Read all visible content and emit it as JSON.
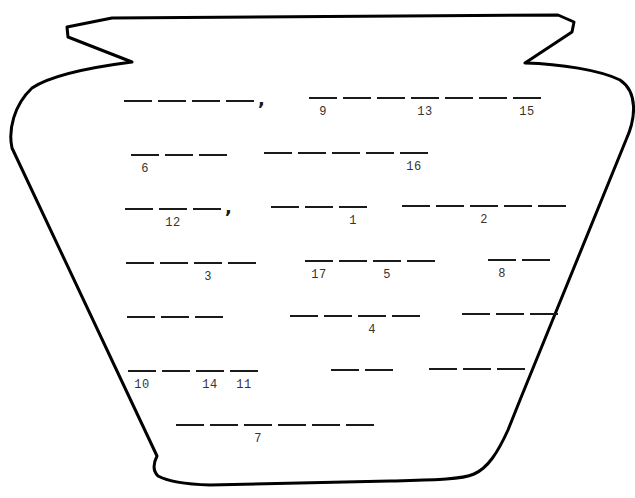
{
  "worksheet": {
    "type": "cryptogram-fill-in-the-blanks",
    "shape": "vase-outline",
    "colors": {
      "outline": "#000000",
      "blank": "#1a1a1a",
      "number": "#333333",
      "background": "#ffffff"
    },
    "rows": [
      {
        "words": [
          {
            "x": 124,
            "y": 100,
            "blanks": 4,
            "comma": true,
            "numbers": []
          },
          {
            "x": 309,
            "y": 97,
            "blanks": 7,
            "comma": false,
            "numbers": [
              {
                "blank": 1,
                "value": "9"
              },
              {
                "blank": 4,
                "value": "13"
              },
              {
                "blank": 7,
                "value": "15"
              }
            ]
          }
        ]
      },
      {
        "words": [
          {
            "x": 131,
            "y": 154,
            "blanks": 3,
            "comma": false,
            "numbers": [
              {
                "blank": 1,
                "value": "6"
              }
            ]
          },
          {
            "x": 264,
            "y": 152,
            "blanks": 5,
            "comma": false,
            "numbers": [
              {
                "blank": 5,
                "value": "16"
              }
            ]
          }
        ]
      },
      {
        "words": [
          {
            "x": 125,
            "y": 208,
            "blanks": 3,
            "comma": true,
            "numbers": [
              {
                "blank": 2,
                "value": "12"
              }
            ]
          },
          {
            "x": 271,
            "y": 206,
            "blanks": 3,
            "comma": false,
            "numbers": [
              {
                "blank": 3,
                "value": "1"
              }
            ]
          },
          {
            "x": 402,
            "y": 205,
            "blanks": 5,
            "comma": false,
            "numbers": [
              {
                "blank": 3,
                "value": "2"
              }
            ]
          }
        ]
      },
      {
        "words": [
          {
            "x": 126,
            "y": 262,
            "blanks": 4,
            "comma": false,
            "numbers": [
              {
                "blank": 3,
                "value": "3"
              }
            ]
          },
          {
            "x": 305,
            "y": 260,
            "blanks": 4,
            "comma": false,
            "numbers": [
              {
                "blank": 1,
                "value": "17"
              },
              {
                "blank": 3,
                "value": "5"
              }
            ]
          },
          {
            "x": 488,
            "y": 259,
            "blanks": 2,
            "comma": false,
            "numbers": [
              {
                "blank": 1,
                "value": "8"
              }
            ]
          }
        ]
      },
      {
        "words": [
          {
            "x": 127,
            "y": 316,
            "blanks": 3,
            "comma": false,
            "numbers": []
          },
          {
            "x": 290,
            "y": 315,
            "blanks": 4,
            "comma": false,
            "numbers": [
              {
                "blank": 3,
                "value": "4"
              }
            ]
          },
          {
            "x": 462,
            "y": 313,
            "blanks": 3,
            "comma": false,
            "numbers": []
          }
        ]
      },
      {
        "words": [
          {
            "x": 128,
            "y": 370,
            "blanks": 4,
            "comma": false,
            "numbers": [
              {
                "blank": 1,
                "value": "10"
              },
              {
                "blank": 3,
                "value": "14"
              },
              {
                "blank": 4,
                "value": "11"
              }
            ]
          },
          {
            "x": 331,
            "y": 369,
            "blanks": 2,
            "comma": false,
            "numbers": []
          },
          {
            "x": 429,
            "y": 368,
            "blanks": 3,
            "comma": false,
            "numbers": []
          }
        ]
      },
      {
        "words": [
          {
            "x": 176,
            "y": 424,
            "blanks": 6,
            "comma": false,
            "numbers": [
              {
                "blank": 3,
                "value": "7"
              }
            ]
          }
        ]
      }
    ]
  }
}
